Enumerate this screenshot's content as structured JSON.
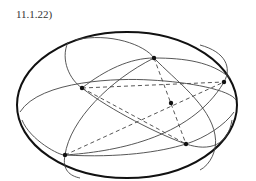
{
  "figure": {
    "label": "11.1.22)",
    "points": [
      {
        "id": "A",
        "x": 154,
        "y": 58
      },
      {
        "id": "B",
        "x": 224,
        "y": 82
      },
      {
        "id": "C",
        "x": 171,
        "y": 103
      },
      {
        "id": "D",
        "x": 82,
        "y": 88
      },
      {
        "id": "E",
        "x": 65,
        "y": 155
      },
      {
        "id": "F",
        "x": 186,
        "y": 144
      }
    ],
    "colors": {
      "stroke": "#222222",
      "thin": "#444444"
    }
  }
}
